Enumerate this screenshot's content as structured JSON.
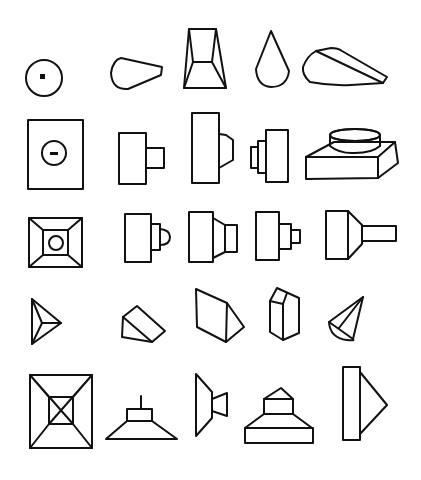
{
  "diagram": {
    "stroke_color": "#111111",
    "background": "#ffffff",
    "grid": {
      "rows": 5,
      "columns": 5
    },
    "figures": [
      {
        "row": 1,
        "col": 1,
        "id": "circle-with-dot",
        "label": "circle with center point"
      },
      {
        "row": 1,
        "col": 2,
        "id": "tapered-cam",
        "label": "tapered cam profile"
      },
      {
        "row": 1,
        "col": 3,
        "id": "frustum-front",
        "label": "truncated pyramid view"
      },
      {
        "row": 1,
        "col": 4,
        "id": "teardrop",
        "label": "teardrop profile"
      },
      {
        "row": 1,
        "col": 5,
        "id": "cam-iso",
        "label": "cam solid isometric"
      },
      {
        "row": 2,
        "col": 1,
        "id": "rect-with-circle",
        "label": "rectangle with circle and slot"
      },
      {
        "row": 2,
        "col": 2,
        "id": "rect-step",
        "label": "rectangle with square boss"
      },
      {
        "row": 2,
        "col": 3,
        "id": "tall-rect-chamfer",
        "label": "tall block with chamfered boss"
      },
      {
        "row": 2,
        "col": 4,
        "id": "triple-step",
        "label": "stepped blocks"
      },
      {
        "row": 2,
        "col": 5,
        "id": "block-cylinder-iso",
        "label": "block with cylinder isometric"
      },
      {
        "row": 3,
        "col": 1,
        "id": "frustum-top",
        "label": "frustum top view with hole"
      },
      {
        "row": 3,
        "col": 2,
        "id": "rect-round-boss",
        "label": "block with rounded boss"
      },
      {
        "row": 3,
        "col": 3,
        "id": "rect-taper-boss",
        "label": "block with tapered boss"
      },
      {
        "row": 3,
        "col": 4,
        "id": "rect-double-step",
        "label": "block with two steps"
      },
      {
        "row": 3,
        "col": 5,
        "id": "rect-taper-shaft",
        "label": "block with tapered shaft"
      },
      {
        "row": 4,
        "col": 1,
        "id": "pyramid-top",
        "label": "triangular pyramid top view"
      },
      {
        "row": 4,
        "col": 2,
        "id": "wedge-small",
        "label": "small wedge isometric"
      },
      {
        "row": 4,
        "col": 3,
        "id": "wedge-large",
        "label": "large wedge isometric"
      },
      {
        "row": 4,
        "col": 4,
        "id": "pentagonal-prism",
        "label": "pentagonal prism isometric"
      },
      {
        "row": 4,
        "col": 5,
        "id": "half-cone",
        "label": "half cone isometric"
      },
      {
        "row": 5,
        "col": 1,
        "id": "frustum-square-top",
        "label": "square frustum top view"
      },
      {
        "row": 5,
        "col": 2,
        "id": "lamp-shape",
        "label": "frustum with post front view"
      },
      {
        "row": 5,
        "col": 3,
        "id": "trapezoid-side",
        "label": "tapered side view"
      },
      {
        "row": 5,
        "col": 4,
        "id": "house-stack",
        "label": "stacked base with roof"
      },
      {
        "row": 5,
        "col": 5,
        "id": "rect-triangle",
        "label": "tall rectangle with triangle"
      }
    ]
  }
}
